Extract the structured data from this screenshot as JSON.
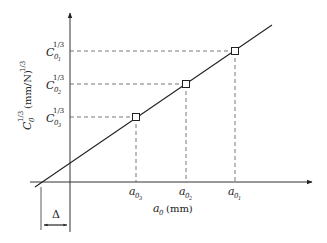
{
  "diagram": {
    "y_axis_label": {
      "main": "C",
      "sub": "0",
      "sup": "1/3",
      "unit": "(mm/N)",
      "unit_sup": "1/3"
    },
    "x_axis_label": {
      "main": "a",
      "sub": "0",
      "unit": "(mm)"
    },
    "y_ticks": [
      {
        "main": "C",
        "sub": "0",
        "subsub": "1",
        "sup": "1/3"
      },
      {
        "main": "C",
        "sub": "0",
        "subsub": "2",
        "sup": "1/3"
      },
      {
        "main": "C",
        "sub": "0",
        "subsub": "3",
        "sup": "1/3"
      }
    ],
    "x_ticks": [
      {
        "main": "a",
        "sub": "0",
        "subsub": "3"
      },
      {
        "main": "a",
        "sub": "0",
        "subsub": "2"
      },
      {
        "main": "a",
        "sub": "0",
        "subsub": "1"
      }
    ],
    "offset_label": "Δ",
    "colors": {
      "line": "#222222",
      "dash": "#555555"
    }
  }
}
